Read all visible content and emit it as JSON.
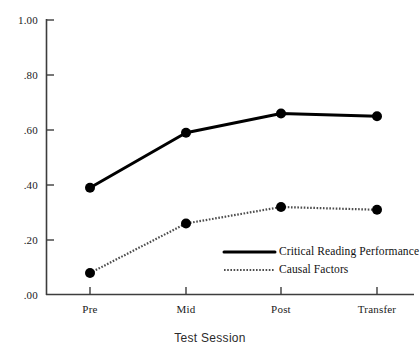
{
  "chart_data": {
    "type": "line",
    "title": "",
    "xlabel": "Test Session",
    "ylabel": "",
    "categories": [
      "Pre",
      "Mid",
      "Post",
      "Transfer"
    ],
    "ylim": [
      0.0,
      1.0
    ],
    "ytick_labels": [
      "1.00",
      ".80",
      ".60",
      ".40",
      ".20",
      ".00"
    ],
    "ytick_values": [
      1.0,
      0.8,
      0.6,
      0.4,
      0.2,
      0.0
    ],
    "grid": false,
    "legend_position": "inside-lower-right",
    "series": [
      {
        "name": "Critical Reading Performance",
        "style": "solid",
        "color": "#000000",
        "marker": "filled-circle",
        "values": [
          0.39,
          0.59,
          0.66,
          0.65
        ]
      },
      {
        "name": "Causal Factors",
        "style": "dotted",
        "color": "#4d4d4d",
        "marker": "filled-circle",
        "values": [
          0.08,
          0.26,
          0.32,
          0.31
        ]
      }
    ]
  },
  "axis": {
    "xlabel": "Test Session"
  },
  "legend": {
    "entries": [
      {
        "label": "Critical Reading Performance"
      },
      {
        "label": "Causal Factors"
      }
    ]
  }
}
